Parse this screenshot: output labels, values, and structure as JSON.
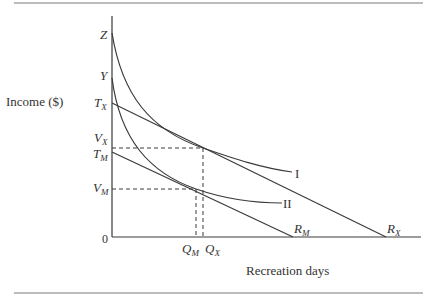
{
  "figure": {
    "y_axis_label": "Income ($)",
    "x_axis_label": "Recreation days",
    "origin_label": "0",
    "y_points": [
      {
        "id": "Z",
        "main": "Z",
        "sub": "",
        "y": 35
      },
      {
        "id": "Y",
        "main": "Y",
        "sub": "",
        "y": 76
      },
      {
        "id": "TX",
        "main": "T",
        "sub": "X",
        "y": 103
      },
      {
        "id": "VX",
        "main": "V",
        "sub": "X",
        "y": 148
      },
      {
        "id": "TM",
        "main": "T",
        "sub": "M",
        "y": 156
      },
      {
        "id": "VM",
        "main": "V",
        "sub": "M",
        "y": 189
      }
    ],
    "x_points": [
      {
        "id": "QM",
        "main": "Q",
        "sub": "M"
      },
      {
        "id": "QX",
        "main": "Q",
        "sub": "X"
      },
      {
        "id": "RM",
        "main": "R",
        "sub": "M"
      },
      {
        "id": "RX",
        "main": "R",
        "sub": "X"
      }
    ],
    "curves": [
      {
        "id": "I",
        "label": "I",
        "description": "Indifference curve I, tangent to budget line TX-RX at (QX, VX)"
      },
      {
        "id": "II",
        "label": "II",
        "description": "Indifference curve II, tangent to budget line TM-RM at (QM, VM)"
      }
    ],
    "budget_lines": [
      {
        "id": "TX-RX",
        "from": "TX",
        "to": "RX"
      },
      {
        "id": "TM-RM",
        "from": "TM",
        "to": "RM"
      }
    ],
    "colors": {
      "line": "#3a3a3a",
      "rule": "#7a7a7a",
      "text": "#333333"
    }
  }
}
